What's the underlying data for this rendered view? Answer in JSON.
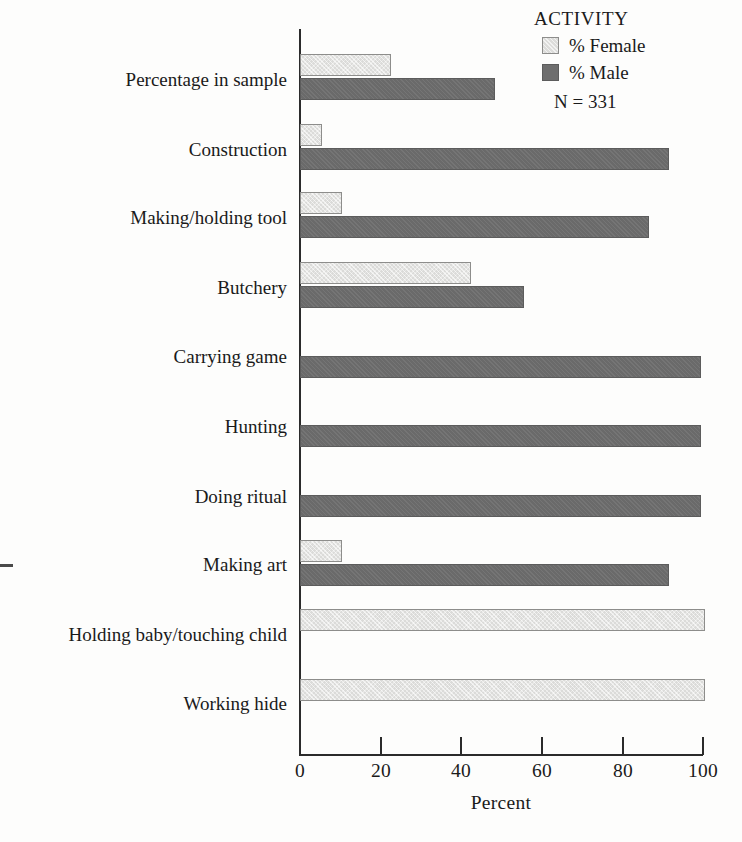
{
  "chart_data": {
    "type": "bar",
    "orientation": "horizontal",
    "title": "",
    "xlabel": "Percent",
    "ylabel": "",
    "xlim": [
      0,
      100
    ],
    "xticks": [
      0,
      20,
      40,
      60,
      80,
      100
    ],
    "grid": false,
    "legend_position": "top-right",
    "legend_title": "ACTIVITY",
    "annotations": [
      "N = 331"
    ],
    "categories": [
      "Percentage in sample",
      "Construction",
      "Making/holding tool",
      "Butchery",
      "Carrying game",
      "Hunting",
      "Doing ritual",
      "Making art",
      "Holding baby/touching child",
      "Working hide"
    ],
    "series": [
      {
        "name": "% Female",
        "color": "#e3e3e1",
        "values": [
          22,
          5,
          10,
          42,
          0,
          0,
          0,
          10,
          100,
          100
        ]
      },
      {
        "name": "% Male",
        "color": "#6e6e6e",
        "values": [
          48,
          91,
          86,
          55,
          99,
          99,
          99,
          91,
          0,
          0
        ]
      }
    ]
  },
  "axis": {
    "tick_labels": [
      "0",
      "20",
      "40",
      "60",
      "80",
      "100"
    ],
    "x_title": "Percent"
  },
  "legend": {
    "title": "ACTIVITY",
    "female_label": "% Female",
    "male_label": "% Male",
    "sample_size": "N = 331"
  }
}
